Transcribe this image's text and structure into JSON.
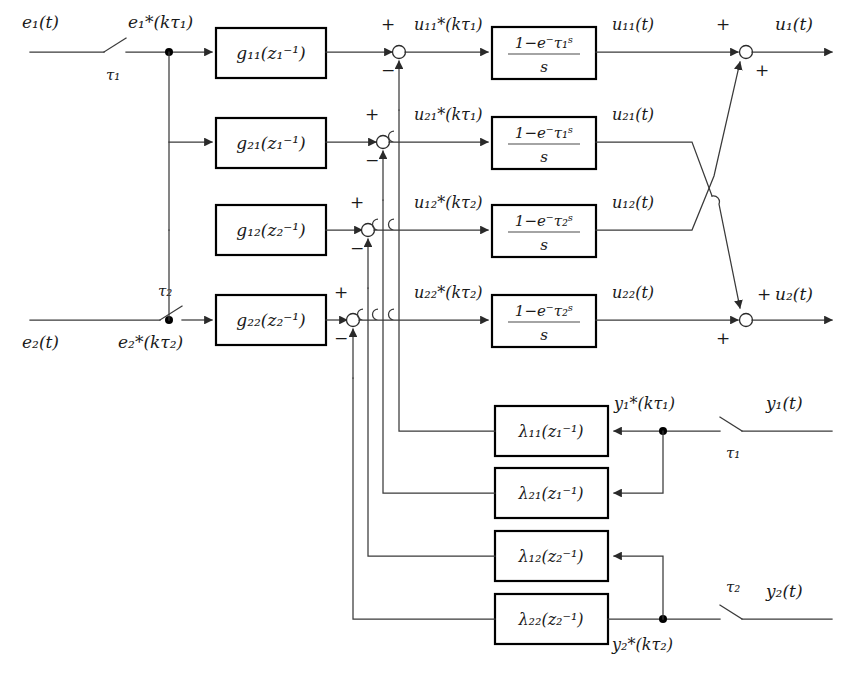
{
  "figure": {
    "kind": "control-system-block-diagram",
    "colors": {
      "background": "#ffffff",
      "wire": "#3a3a3a",
      "block_border": "#000000",
      "block_fill": "#ffffff",
      "text": "#1a1a1a"
    }
  },
  "inputs": [
    {
      "name": "input-e1",
      "continuous_label": "e₁(t)",
      "sampler_label": "τ₁",
      "sampled_label": "e₁*(kτ₁)"
    },
    {
      "name": "input-e2",
      "continuous_label": "e₂(t)",
      "sampler_label": "τ₂",
      "sampled_label": "e₂*(kτ₂)"
    }
  ],
  "controller_blocks": [
    {
      "name": "g11",
      "label": "g₁₁(z₁⁻¹)"
    },
    {
      "name": "g21",
      "label": "g₂₁(z₁⁻¹)"
    },
    {
      "name": "g12",
      "label": "g₁₂(z₂⁻¹)"
    },
    {
      "name": "g22",
      "label": "g₂₂(z₂⁻¹)"
    }
  ],
  "sum_junctions": [
    {
      "name": "sum-u11",
      "plus": "+",
      "minus": "−"
    },
    {
      "name": "sum-u21",
      "plus": "+",
      "minus": "−"
    },
    {
      "name": "sum-u12",
      "plus": "+",
      "minus": "−"
    },
    {
      "name": "sum-u22",
      "plus": "+",
      "minus": "−"
    }
  ],
  "sampled_signals": [
    {
      "name": "u11-star",
      "label": "u₁₁*(kτ₁)"
    },
    {
      "name": "u21-star",
      "label": "u₂₁*(kτ₁)"
    },
    {
      "name": "u12-star",
      "label": "u₁₂*(kτ₂)"
    },
    {
      "name": "u22-star",
      "label": "u₂₂*(kτ₂)"
    }
  ],
  "hold_blocks": [
    {
      "name": "hold-11",
      "numerator": "1−e⁻τ₁ˢ",
      "denominator": "s"
    },
    {
      "name": "hold-21",
      "numerator": "1−e⁻τ₁ˢ",
      "denominator": "s"
    },
    {
      "name": "hold-12",
      "numerator": "1−e⁻τ₂ˢ",
      "denominator": "s"
    },
    {
      "name": "hold-22",
      "numerator": "1−e⁻τ₂ˢ",
      "denominator": "s"
    }
  ],
  "hold_outputs": [
    {
      "name": "u11-out",
      "label": "u₁₁(t)"
    },
    {
      "name": "u21-out",
      "label": "u₂₁(t)"
    },
    {
      "name": "u12-out",
      "label": "u₁₂(t)"
    },
    {
      "name": "u22-out",
      "label": "u₂₂(t)"
    }
  ],
  "output_sums": [
    {
      "name": "sum-u1",
      "top_sign": "+",
      "bottom_sign": "+",
      "label": "u₁(t)"
    },
    {
      "name": "sum-u2",
      "top_sign": "+",
      "bottom_sign": "+",
      "label": "u₂(t)"
    }
  ],
  "feedback_blocks": [
    {
      "name": "lambda11",
      "label": "λ₁₁(z₁⁻¹)"
    },
    {
      "name": "lambda21",
      "label": "λ₂₁(z₁⁻¹)"
    },
    {
      "name": "lambda12",
      "label": "λ₁₂(z₂⁻¹)"
    },
    {
      "name": "lambda22",
      "label": "λ₂₂(z₂⁻¹)"
    }
  ],
  "feedback_inputs": [
    {
      "name": "output-y1",
      "continuous_label": "y₁(t)",
      "sampler_label": "τ₁",
      "sampled_label": "y₁*(kτ₁)"
    },
    {
      "name": "output-y2",
      "continuous_label": "y₂(t)",
      "sampler_label": "τ₂",
      "sampled_label": "y₂*(kτ₂)"
    }
  ]
}
